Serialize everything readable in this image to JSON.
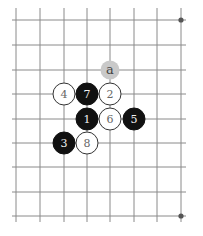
{
  "diagram": {
    "type": "go-board-fragment",
    "grid": {
      "columns_x": [
        16,
        40,
        64,
        87,
        110,
        134,
        157,
        181
      ],
      "rows_y": [
        20,
        45,
        70,
        94,
        119,
        143,
        167,
        192,
        216
      ],
      "line_extent": {
        "x_min": 12,
        "x_max": 186,
        "y_min": 8,
        "y_max": 222
      }
    },
    "star_points": [
      {
        "col": 7,
        "row": 0
      },
      {
        "col": 7,
        "row": 8
      }
    ],
    "stones": [
      {
        "move": "1",
        "color": "black",
        "col": 3,
        "row": 4
      },
      {
        "move": "2",
        "color": "white",
        "col": 4,
        "row": 3
      },
      {
        "move": "3",
        "color": "black",
        "col": 2,
        "row": 5
      },
      {
        "move": "4",
        "color": "white",
        "col": 2,
        "row": 3
      },
      {
        "move": "5",
        "color": "black",
        "col": 5,
        "row": 4
      },
      {
        "move": "6",
        "color": "white",
        "col": 4,
        "row": 4
      },
      {
        "move": "7",
        "color": "black",
        "col": 3,
        "row": 3
      },
      {
        "move": "8",
        "color": "white",
        "col": 3,
        "row": 5
      }
    ],
    "markers": [
      {
        "label": "a",
        "col": 4,
        "row": 2
      }
    ],
    "colors": {
      "grid": "#8a8a8a",
      "black_stone": "#111111",
      "white_stone": "#ffffff",
      "marker": "#c9c9c9"
    }
  }
}
